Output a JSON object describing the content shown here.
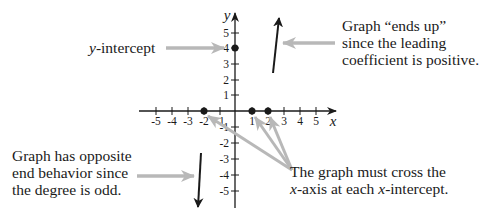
{
  "diagram": {
    "type": "polynomial-end-behavior-sketch",
    "axes": {
      "x_label": "x",
      "y_label": "y",
      "x_ticks": [
        "-5",
        "-4",
        "-3",
        "-2",
        "-1",
        "1",
        "2",
        "3",
        "4",
        "5"
      ],
      "y_ticks": [
        "5",
        "4",
        "3",
        "2",
        "1",
        "-1",
        "-2",
        "-3",
        "-4",
        "-5"
      ],
      "x_range": [
        -5,
        5
      ],
      "y_range": [
        -5,
        5
      ]
    },
    "points": {
      "y_intercept": {
        "x": 0,
        "y": 4
      },
      "x_intercepts": [
        -2,
        1,
        2
      ]
    },
    "end_behavior": {
      "right": "up",
      "left": "down"
    },
    "annotations": {
      "y_intercept": "y-intercept",
      "right_end": [
        "Graph “ends up”",
        "since the leading",
        "coefficient is positive."
      ],
      "left_end": [
        "Graph has opposite",
        "end behavior since",
        "the degree is odd."
      ],
      "x_intercepts": [
        "The graph must cross the",
        "x-axis at each x-intercept."
      ]
    },
    "colors": {
      "ink": "#1a1a1a",
      "pointer_gray": "#b8b8b8",
      "background": "#ffffff"
    }
  }
}
